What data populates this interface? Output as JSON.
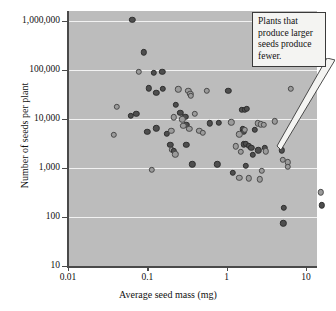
{
  "chart_data": {
    "type": "scatter",
    "title": "",
    "xlabel": "Average seed mass (mg)",
    "ylabel": "Number of seeds per plant",
    "xscale": "log",
    "yscale": "log",
    "xlim": [
      0.01,
      20
    ],
    "ylim": [
      10,
      2000000
    ],
    "xticks": [
      0.01,
      0.1,
      1,
      10
    ],
    "xtick_labels": [
      "0.01",
      "0.1",
      "1",
      "10"
    ],
    "yticks": [
      10,
      100,
      1000,
      10000,
      100000,
      1000000
    ],
    "ytick_labels": [
      "10",
      "100",
      "1,000",
      "10,000",
      "100,000",
      "1,000,000"
    ],
    "grid": true,
    "grid_color": "#f2f2f2",
    "plot_background": "#bcbcbc",
    "legend": null,
    "marker_colors": {
      "dark": "#4e4e4e",
      "light": "#9b9b9b",
      "edge": "#2e2e2e"
    },
    "annotations": [
      {
        "text": "Plants that produce larger seeds produce fewer.",
        "x": 5.2,
        "y": 2600,
        "box_position": "top-right"
      }
    ],
    "series": [
      {
        "name": "Seed mass vs seed number",
        "points": [
          {
            "x": 0.065,
            "y": 1050000,
            "c": "dark"
          },
          {
            "x": 0.09,
            "y": 230000,
            "c": "dark"
          },
          {
            "x": 0.078,
            "y": 92000,
            "c": "light"
          },
          {
            "x": 0.12,
            "y": 88000,
            "c": "dark"
          },
          {
            "x": 0.155,
            "y": 92000,
            "c": "dark"
          },
          {
            "x": 0.105,
            "y": 42000,
            "c": "dark"
          },
          {
            "x": 0.13,
            "y": 34000,
            "c": "dark"
          },
          {
            "x": 0.158,
            "y": 41000,
            "c": "dark"
          },
          {
            "x": 0.245,
            "y": 40000,
            "c": "light"
          },
          {
            "x": 0.33,
            "y": 38000,
            "c": "light"
          },
          {
            "x": 0.35,
            "y": 33000,
            "c": "light"
          },
          {
            "x": 0.355,
            "y": 29500,
            "c": "light"
          },
          {
            "x": 0.56,
            "y": 38000,
            "c": "light"
          },
          {
            "x": 1.05,
            "y": 38000,
            "c": "dark"
          },
          {
            "x": 6.4,
            "y": 41000,
            "c": "light"
          },
          {
            "x": 0.041,
            "y": 17500,
            "c": "light"
          },
          {
            "x": 0.062,
            "y": 11500,
            "c": "dark"
          },
          {
            "x": 0.073,
            "y": 12800,
            "c": "dark"
          },
          {
            "x": 0.23,
            "y": 19500,
            "c": "dark"
          },
          {
            "x": 0.26,
            "y": 13500,
            "c": "dark"
          },
          {
            "x": 0.3,
            "y": 11200,
            "c": "dark"
          },
          {
            "x": 0.215,
            "y": 10800,
            "c": "light"
          },
          {
            "x": 0.395,
            "y": 12800,
            "c": "light"
          },
          {
            "x": 1.55,
            "y": 15500,
            "c": "dark"
          },
          {
            "x": 1.7,
            "y": 15200,
            "c": "dark"
          },
          {
            "x": 1.8,
            "y": 16000,
            "c": "dark"
          },
          {
            "x": 0.275,
            "y": 9800,
            "c": "light"
          },
          {
            "x": 0.31,
            "y": 7600,
            "c": "dark"
          },
          {
            "x": 0.61,
            "y": 8200,
            "c": "dark"
          },
          {
            "x": 0.795,
            "y": 8300,
            "c": "dark"
          },
          {
            "x": 1.15,
            "y": 8500,
            "c": "light"
          },
          {
            "x": 2.45,
            "y": 8100,
            "c": "light"
          },
          {
            "x": 2.7,
            "y": 7800,
            "c": "light"
          },
          {
            "x": 2.95,
            "y": 7700,
            "c": "light"
          },
          {
            "x": 4.05,
            "y": 8900,
            "c": "light"
          },
          {
            "x": 0.038,
            "y": 4800,
            "c": "light"
          },
          {
            "x": 0.1,
            "y": 5500,
            "c": "dark"
          },
          {
            "x": 0.13,
            "y": 6400,
            "c": "dark"
          },
          {
            "x": 0.175,
            "y": 5000,
            "c": "dark"
          },
          {
            "x": 0.2,
            "y": 5700,
            "c": "light"
          },
          {
            "x": 0.285,
            "y": 7200,
            "c": "light"
          },
          {
            "x": 0.34,
            "y": 6300,
            "c": "light"
          },
          {
            "x": 0.45,
            "y": 5700,
            "c": "light"
          },
          {
            "x": 0.5,
            "y": 5300,
            "c": "light"
          },
          {
            "x": 1.6,
            "y": 6200,
            "c": "dark"
          },
          {
            "x": 1.65,
            "y": 5600,
            "c": "dark"
          },
          {
            "x": 1.7,
            "y": 6000,
            "c": "light"
          },
          {
            "x": 2.25,
            "y": 6000,
            "c": "dark"
          },
          {
            "x": 1.45,
            "y": 4900,
            "c": "light"
          },
          {
            "x": 0.195,
            "y": 2950,
            "c": "dark"
          },
          {
            "x": 0.205,
            "y": 2350,
            "c": "light"
          },
          {
            "x": 0.215,
            "y": 2250,
            "c": "dark"
          },
          {
            "x": 0.225,
            "y": 1900,
            "c": "light"
          },
          {
            "x": 0.31,
            "y": 2950,
            "c": "dark"
          },
          {
            "x": 1.3,
            "y": 2750,
            "c": "light"
          },
          {
            "x": 1.65,
            "y": 3050,
            "c": "dark"
          },
          {
            "x": 1.75,
            "y": 3100,
            "c": "dark"
          },
          {
            "x": 1.9,
            "y": 2800,
            "c": "dark"
          },
          {
            "x": 2.05,
            "y": 2550,
            "c": "dark"
          },
          {
            "x": 1.5,
            "y": 2150,
            "c": "light"
          },
          {
            "x": 2.15,
            "y": 1850,
            "c": "dark"
          },
          {
            "x": 2.5,
            "y": 2300,
            "c": "dark"
          },
          {
            "x": 3.0,
            "y": 2550,
            "c": "dark"
          },
          {
            "x": 3.1,
            "y": 2200,
            "c": "light"
          },
          {
            "x": 4.95,
            "y": 2300,
            "c": "dark"
          },
          {
            "x": 5.1,
            "y": 1450,
            "c": "light"
          },
          {
            "x": 5.85,
            "y": 1300,
            "c": "light"
          },
          {
            "x": 5.9,
            "y": 1050,
            "c": "light"
          },
          {
            "x": 0.37,
            "y": 1180,
            "c": "dark"
          },
          {
            "x": 0.76,
            "y": 1200,
            "c": "dark"
          },
          {
            "x": 1.2,
            "y": 800,
            "c": "dark"
          },
          {
            "x": 1.75,
            "y": 1120,
            "c": "dark"
          },
          {
            "x": 0.113,
            "y": 930,
            "c": "light"
          },
          {
            "x": 1.45,
            "y": 630,
            "c": "light"
          },
          {
            "x": 1.9,
            "y": 620,
            "c": "light"
          },
          {
            "x": 2.6,
            "y": 590,
            "c": "light"
          },
          {
            "x": 2.75,
            "y": 880,
            "c": "light"
          },
          {
            "x": 15.5,
            "y": 320,
            "c": "light"
          },
          {
            "x": 5.25,
            "y": 152,
            "c": "dark"
          },
          {
            "x": 15.8,
            "y": 172,
            "c": "dark"
          },
          {
            "x": 5.15,
            "y": 75,
            "c": "dark"
          }
        ]
      }
    ]
  }
}
